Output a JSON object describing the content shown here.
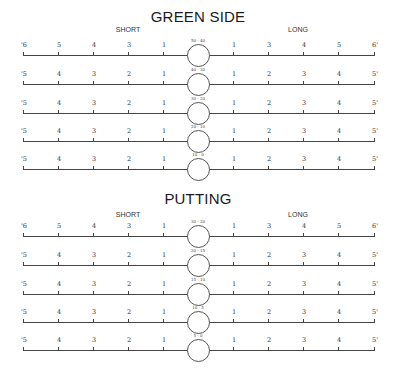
{
  "sections": [
    {
      "title": "GREEN SIDE",
      "short_label": "SHORT",
      "long_label": "LONG",
      "rows": [
        {
          "range": "50 - 40",
          "left": [
            "'6",
            "5",
            "4",
            "3",
            "1"
          ],
          "right": [
            "1",
            "3",
            "4",
            "5",
            "6'"
          ]
        },
        {
          "range": "40 - 30",
          "left": [
            "'5",
            "4",
            "3",
            "2",
            "1"
          ],
          "right": [
            "1",
            "2",
            "3",
            "4",
            "5'"
          ]
        },
        {
          "range": "30 - 20",
          "left": [
            "'5",
            "4",
            "3",
            "2",
            "1"
          ],
          "right": [
            "1",
            "2",
            "3",
            "4",
            "5'"
          ]
        },
        {
          "range": "20 - 10",
          "left": [
            "'5",
            "4",
            "3",
            "2",
            "1"
          ],
          "right": [
            "1",
            "2",
            "3",
            "4",
            "5'"
          ]
        },
        {
          "range": "10 - 0",
          "left": [
            "'5",
            "4",
            "3",
            "2",
            "1"
          ],
          "right": [
            "1",
            "2",
            "3",
            "4",
            "5'"
          ]
        }
      ]
    },
    {
      "title": "PUTTING",
      "short_label": "SHORT",
      "long_label": "LONG",
      "rows": [
        {
          "range": "30 - 20",
          "left": [
            "'6",
            "5",
            "4",
            "3",
            "1"
          ],
          "right": [
            "1",
            "3",
            "4",
            "5",
            "6'"
          ]
        },
        {
          "range": "20 - 15",
          "left": [
            "'5",
            "4",
            "3",
            "2",
            "1"
          ],
          "right": [
            "1",
            "2",
            "3",
            "4",
            "5'"
          ]
        },
        {
          "range": "15 - 10",
          "left": [
            "'5",
            "4",
            "3",
            "2",
            "1"
          ],
          "right": [
            "1",
            "2",
            "3",
            "4",
            "5'"
          ]
        },
        {
          "range": "10 - 5",
          "left": [
            "'5",
            "4",
            "3",
            "2",
            "1"
          ],
          "right": [
            "1",
            "2",
            "3",
            "4",
            "5'"
          ]
        },
        {
          "range": "5 - 0",
          "left": [
            "'5",
            "4",
            "3",
            "2",
            "1"
          ],
          "right": [
            "1",
            "2",
            "3",
            "4",
            "5'"
          ]
        }
      ]
    }
  ]
}
